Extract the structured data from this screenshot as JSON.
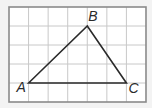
{
  "diagram": {
    "type": "triangle-on-grid",
    "grid": {
      "columns": 7,
      "rows": 5,
      "origin_px": [
        9,
        7
      ],
      "cell_w_px": 19.57,
      "cell_h_px": 19.0,
      "frame_color": "#8a8a8a",
      "line_color": "#c8c8c8",
      "background": "#ffffff"
    },
    "triangle": {
      "stroke_color": "#2a2a2a",
      "stroke_width": 1.6
    },
    "vertices": [
      {
        "label": "A",
        "grid": [
          1,
          4
        ],
        "label_offset": [
          -12,
          9
        ]
      },
      {
        "label": "B",
        "grid": [
          4,
          1
        ],
        "label_offset": [
          1,
          -5
        ]
      },
      {
        "label": "C",
        "grid": [
          6,
          4
        ],
        "label_offset": [
          2,
          10
        ]
      }
    ]
  }
}
